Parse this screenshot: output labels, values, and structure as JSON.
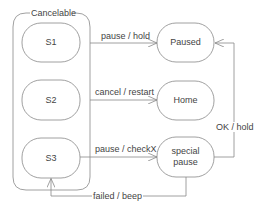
{
  "diagram": {
    "type": "state-machine",
    "colors": {
      "stroke": "#888888",
      "text": "#444444",
      "background": "#ffffff"
    },
    "container": {
      "label": "Cancelable"
    },
    "states": {
      "s1": "S1",
      "s2": "S2",
      "s3": "S3",
      "paused": "Paused",
      "home": "Home",
      "special_pause_line1": "special",
      "special_pause_line2": "pause"
    },
    "transitions": {
      "s1_to_paused": "pause / hold",
      "s2_to_home": "cancel / restart",
      "s3_to_special": "pause / checkX",
      "special_to_paused": "OK / hold",
      "special_to_s3": "failed / beep"
    }
  }
}
